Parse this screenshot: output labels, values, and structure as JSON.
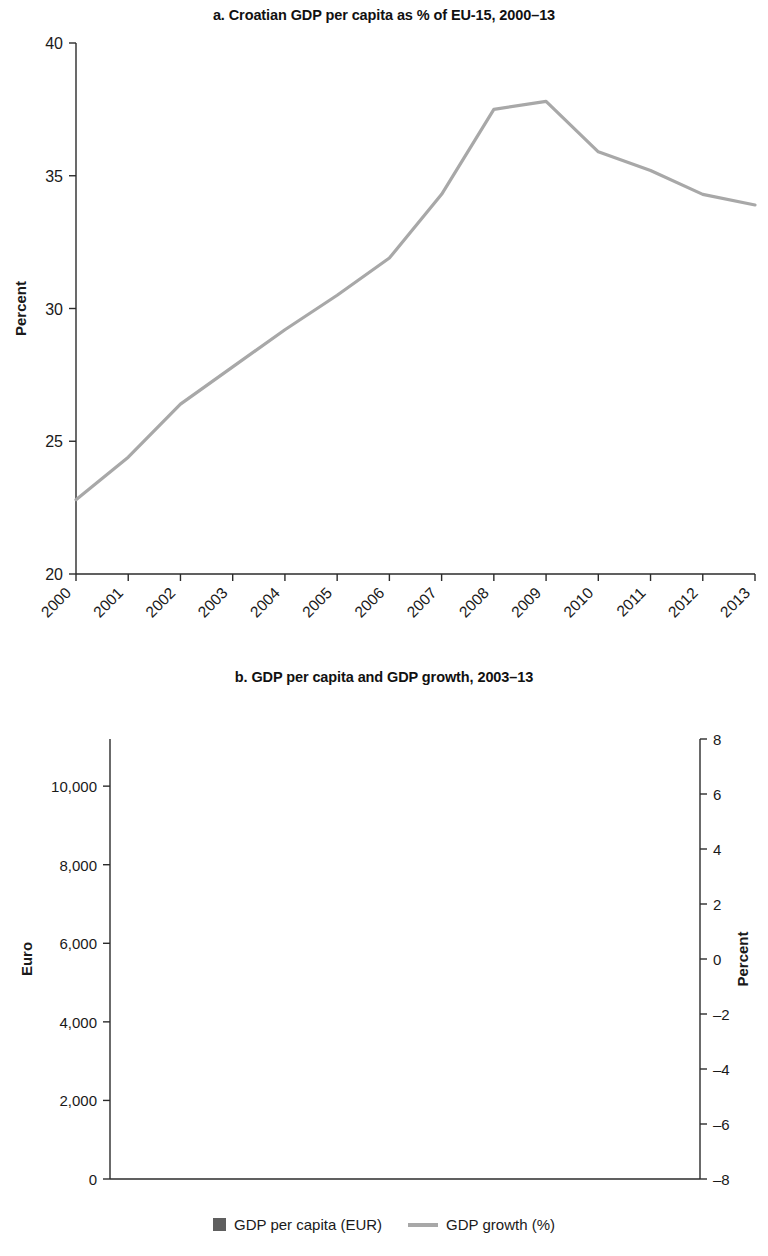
{
  "panel_a": {
    "title": "a. Croatian GDP per capita as % of EU-15, 2000–13",
    "ylabel": "Percent"
  },
  "panel_b": {
    "title": "b. GDP per capita and GDP growth, 2003–13",
    "ylabel_left": "Euro",
    "ylabel_right": "Percent"
  },
  "legend": {
    "bar_label": "GDP per capita (EUR)",
    "line_label": "GDP growth (%)",
    "bar_color": "#5f5f5f",
    "line_color": "#a8a8a8"
  },
  "chart_data": [
    {
      "type": "line",
      "panel": "a",
      "title": "a. Croatian GDP per capita as % of EU-15, 2000–13",
      "xlabel": "",
      "ylabel": "Percent",
      "ylim": [
        20,
        40
      ],
      "yticks": [
        20,
        25,
        30,
        35,
        40
      ],
      "ytick_labels": [
        "20",
        "25",
        "30",
        "35",
        "40"
      ],
      "grid": false,
      "legend_position": "none",
      "line_color": "#a8a8a8",
      "categories": [
        "2000",
        "2001",
        "2002",
        "2003",
        "2004",
        "2005",
        "2006",
        "2007",
        "2008",
        "2009",
        "2010",
        "2011",
        "2012",
        "2013"
      ],
      "series": [
        {
          "name": "Croatian GDP per capita as % of EU-15",
          "values": [
            22.8,
            24.4,
            26.4,
            27.8,
            29.2,
            30.5,
            31.9,
            34.3,
            37.5,
            37.8,
            35.9,
            35.2,
            34.3,
            33.9
          ]
        }
      ]
    },
    {
      "type": "bar",
      "panel": "b",
      "title": "b. GDP per capita and GDP growth, 2003–13",
      "xlabel": "",
      "ylabel": "Euro",
      "ylabel_secondary": "Percent",
      "ylim": [
        0,
        11200
      ],
      "yticks": [
        0,
        2000,
        4000,
        6000,
        8000,
        10000
      ],
      "ytick_labels": [
        "0",
        "2,000",
        "4,000",
        "6,000",
        "8,000",
        "10,000"
      ],
      "ylim_secondary": [
        -8,
        8
      ],
      "yticks_secondary": [
        -8,
        -6,
        -4,
        -2,
        0,
        2,
        4,
        6,
        8
      ],
      "ytick_labels_secondary": [
        "–8",
        "–6",
        "–4",
        "–2",
        "0",
        "2",
        "4",
        "6",
        "8"
      ],
      "grid": false,
      "legend_position": "bottom",
      "bar_color": "#5f5f5f",
      "line_color": "#a8a8a8",
      "categories": [
        "2003",
        "2004",
        "2005",
        "2006",
        "2007",
        "2008",
        "2009",
        "2010",
        "2011",
        "2012",
        "2013"
      ],
      "series": [
        {
          "name": "GDP per capita (EUR)",
          "axis": "left",
          "kind": "bar",
          "values": [
            6850,
            7450,
            8350,
            9250,
            10100,
            11150,
            10450,
            10400,
            10400,
            10250,
            10200
          ]
        },
        {
          "name": "GDP growth (%)",
          "axis": "right",
          "kind": "line",
          "values": [
            5.3,
            4.0,
            4.2,
            4.8,
            5.2,
            2.1,
            -7.0,
            -2.3,
            -0.3,
            -2.2,
            -0.7
          ]
        }
      ]
    }
  ]
}
